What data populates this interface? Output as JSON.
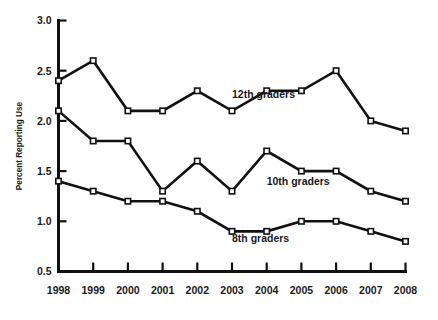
{
  "chart_data": {
    "type": "line",
    "title": "",
    "subtitle": "",
    "xlabel": "",
    "ylabel": "Percent Reporting Use",
    "x": [
      1998,
      1999,
      2000,
      2001,
      2002,
      2003,
      2004,
      2005,
      2006,
      2007,
      2008
    ],
    "categories": [
      "1998",
      "1999",
      "2000",
      "2001",
      "2002",
      "2003",
      "2004",
      "2005",
      "2006",
      "2007",
      "2008"
    ],
    "xlim": [
      1998,
      2008
    ],
    "ylim": [
      0.5,
      3.0
    ],
    "yticks": [
      "0.5",
      "1.0",
      "1.5",
      "2.0",
      "2.5",
      "3.0"
    ],
    "ytick_values": [
      0.5,
      1.0,
      1.5,
      2.0,
      2.5,
      3.0
    ],
    "grid": false,
    "legend_position": "inline-annotations",
    "series": [
      {
        "name": "12th graders",
        "values": [
          2.4,
          2.6,
          2.1,
          2.1,
          2.3,
          2.1,
          2.3,
          2.3,
          2.5,
          2.0,
          1.9
        ],
        "marker": "open-square",
        "color": "#111111"
      },
      {
        "name": "10th graders",
        "values": [
          2.1,
          1.8,
          1.8,
          1.3,
          1.6,
          1.3,
          1.7,
          1.5,
          1.5,
          1.3,
          1.2
        ],
        "marker": "open-square",
        "color": "#111111"
      },
      {
        "name": "8th graders",
        "values": [
          1.4,
          1.3,
          1.2,
          1.2,
          1.1,
          0.9,
          0.9,
          1.0,
          1.0,
          0.9,
          0.8
        ],
        "marker": "open-square",
        "color": "#111111"
      }
    ],
    "annotations": [
      {
        "text": "12th graders",
        "x": 2003,
        "y": 2.23
      },
      {
        "text": "10th graders",
        "x": 2004,
        "y": 1.36
      },
      {
        "text": "8th graders",
        "x": 2003,
        "y": 0.79
      }
    ]
  },
  "axis": {
    "y_title": "Percent Reporting Use"
  }
}
